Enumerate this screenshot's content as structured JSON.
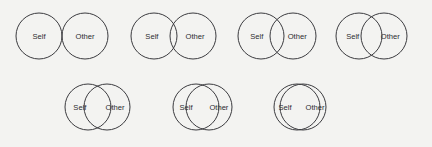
{
  "figure": {
    "name": "inclusion-of-other-in-the-self-scale",
    "background_color": "#f3f3f1",
    "stroke_color": "#3b3b3f",
    "label_color": "#2c2c30",
    "circle_diameter_px": 46,
    "rows": [
      {
        "name": "top-row",
        "item_numbers": [
          1,
          2,
          3,
          4
        ]
      },
      {
        "name": "bottom-row",
        "item_numbers": [
          5,
          6,
          7
        ]
      }
    ]
  },
  "labels": {
    "self": "Self",
    "other": "Other"
  },
  "items": [
    {
      "number": 1,
      "name": "ios-item-1",
      "overlap": "none-tangent",
      "row": "top",
      "x": 14,
      "y": 11,
      "radius": 23,
      "separation": 46,
      "self_label": "Self",
      "other_label": "Other"
    },
    {
      "number": 2,
      "name": "ios-item-2",
      "overlap": "slight",
      "row": "top",
      "x": 129,
      "y": 11,
      "radius": 23,
      "separation": 39,
      "self_label": "Self",
      "other_label": "Other"
    },
    {
      "number": 3,
      "name": "ios-item-3",
      "overlap": "moderate",
      "row": "top",
      "x": 236,
      "y": 11,
      "radius": 23,
      "separation": 32,
      "self_label": "Self",
      "other_label": "Other"
    },
    {
      "number": 4,
      "name": "ios-item-4",
      "overlap": "substantial",
      "row": "top",
      "x": 334,
      "y": 11,
      "radius": 23,
      "separation": 25,
      "self_label": "Self",
      "other_label": "Other"
    },
    {
      "number": 5,
      "name": "ios-item-5",
      "overlap": "large",
      "row": "bottom",
      "x": 63,
      "y": 82,
      "radius": 23,
      "separation": 19,
      "self_label": "Self",
      "other_label": "Other"
    },
    {
      "number": 6,
      "name": "ios-item-6",
      "overlap": "very-large",
      "row": "bottom",
      "x": 171,
      "y": 82,
      "radius": 23,
      "separation": 13,
      "self_label": "Self",
      "other_label": "Other"
    },
    {
      "number": 7,
      "name": "ios-item-7",
      "overlap": "near-complete",
      "row": "bottom",
      "x": 272,
      "y": 82,
      "radius": 23,
      "separation": 6,
      "self_label": "Self",
      "other_label": "Other"
    }
  ]
}
